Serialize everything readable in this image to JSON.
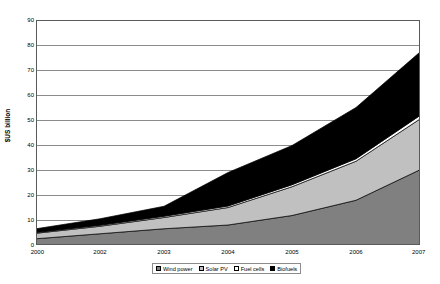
{
  "chart_data": {
    "type": "area",
    "stacked": true,
    "title": "",
    "xlabel": "",
    "ylabel": "$US billion",
    "ylim": [
      0,
      90
    ],
    "ytick_step": 10,
    "yticks": [
      0,
      10,
      20,
      30,
      40,
      50,
      60,
      70,
      80,
      90
    ],
    "grid": true,
    "grid_axis": "y",
    "legend_position": "bottom",
    "categories": [
      "2000",
      "2002",
      "2003",
      "2004",
      "2005",
      "2006",
      "2007"
    ],
    "series": [
      {
        "name": "Wind power",
        "color": "#808080",
        "values": [
          2.5,
          4.5,
          6.5,
          8.0,
          11.8,
          17.9,
          30.1
        ]
      },
      {
        "name": "Solar PV",
        "color": "#c0c0c0",
        "values": [
          2.2,
          3.0,
          4.5,
          7.0,
          11.5,
          15.6,
          20.3
        ]
      },
      {
        "name": "Fuel cells",
        "color": "#ffffff",
        "values": [
          0.3,
          0.4,
          0.5,
          0.6,
          0.8,
          1.0,
          1.4
        ]
      },
      {
        "name": "Biofuels",
        "color": "#000000",
        "values": [
          1.5,
          2.6,
          4.0,
          13.4,
          15.7,
          20.5,
          25.4
        ]
      }
    ],
    "totals": [
      6.5,
      10.5,
      15.5,
      29.0,
      39.8,
      55.0,
      77.2
    ],
    "axis_color": "#5a5a5a",
    "grid_color": "#8c8c8c",
    "plot_border_color": "#5a5a5a"
  },
  "legend": {
    "items": [
      {
        "label": "Wind power",
        "color": "#808080"
      },
      {
        "label": "Solar PV",
        "color": "#c0c0c0"
      },
      {
        "label": "Fuel cells",
        "color": "#ffffff"
      },
      {
        "label": "Biofuels",
        "color": "#000000"
      }
    ]
  }
}
